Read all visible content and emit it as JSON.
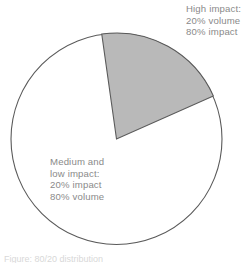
{
  "figure": {
    "background_color": "#ffffff",
    "text_color": "#8a8a8a"
  },
  "labels": {
    "high_impact": {
      "line1": "High impact:",
      "line2": "20% volume",
      "line3": "80% impact"
    },
    "medium_low_impact": {
      "line1": "Medium and",
      "line2": "low impact:",
      "line3": "20% impact",
      "line4": "80% volume"
    }
  },
  "caption": {
    "text": "Figure: 80/20 distribution"
  },
  "chart_data": {
    "type": "pie",
    "title": "",
    "subtitle": "",
    "xlabel": "",
    "ylabel": "",
    "legend_position": "annotations",
    "grid": false,
    "categories": [
      "High impact",
      "Medium and low impact"
    ],
    "values": [
      20,
      80
    ],
    "value_unit": "% volume",
    "start_angle_deg": -8,
    "direction": "clockwise",
    "slices": [
      {
        "name": "High impact",
        "volume_percent": 20,
        "impact_percent": 80,
        "value": 20,
        "fill_color": "#b9b9b9",
        "stroke_color": "#5a5a5a",
        "annotation": "High impact: 20% volume 80% impact",
        "start_angle_deg": -8,
        "end_angle_deg": 66
      },
      {
        "name": "Medium and low impact",
        "volume_percent": 80,
        "impact_percent": 20,
        "value": 80,
        "fill_color": "#ffffff",
        "stroke_color": "#5a5a5a",
        "annotation": "Medium and low impact: 20% impact 80% volume",
        "start_angle_deg": 66,
        "end_angle_deg": 352
      }
    ],
    "geometry": {
      "center_x": 116.5,
      "center_y": 139,
      "radius": 106
    }
  }
}
